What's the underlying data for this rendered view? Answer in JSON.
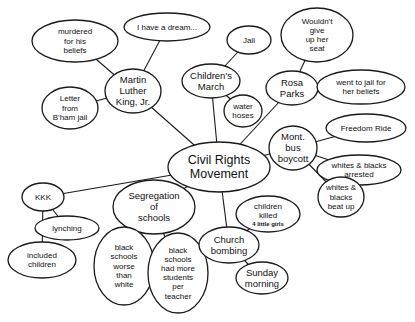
{
  "diagram": {
    "type": "concept-map",
    "central": {
      "id": "crm",
      "lines": [
        "Civil Rights",
        "Movement"
      ]
    },
    "nodes": [
      {
        "id": "crm",
        "lines": [
          "Civil Rights",
          "Movement"
        ],
        "cx": 219,
        "cy": 167,
        "rx": 51,
        "ry": 25,
        "size": "main"
      },
      {
        "id": "mlk",
        "lines": [
          "Martin",
          "Luther",
          "King, Jr."
        ],
        "cx": 133,
        "cy": 91,
        "rx": 28,
        "ry": 22,
        "size": "med"
      },
      {
        "id": "murdered",
        "lines": [
          "murdered",
          "for his",
          "beliefs"
        ],
        "cx": 75,
        "cy": 41,
        "rx": 43,
        "ry": 21,
        "size": "sm"
      },
      {
        "id": "dream",
        "lines": [
          "I have a dream..."
        ],
        "cx": 167,
        "cy": 27,
        "rx": 43,
        "ry": 14,
        "size": "sm"
      },
      {
        "id": "letter",
        "lines": [
          "Letter",
          "from",
          "B'ham jail"
        ],
        "cx": 70,
        "cy": 108,
        "rx": 28,
        "ry": 21,
        "size": "sm"
      },
      {
        "id": "jail",
        "lines": [
          "Jail"
        ],
        "cx": 249,
        "cy": 40,
        "rx": 22,
        "ry": 14,
        "size": "sm"
      },
      {
        "id": "childrens_march",
        "lines": [
          "Children's",
          "March"
        ],
        "cx": 211,
        "cy": 81,
        "rx": 29,
        "ry": 17,
        "size": "med"
      },
      {
        "id": "water_hoses",
        "lines": [
          "water",
          "hoses"
        ],
        "cx": 243,
        "cy": 111,
        "rx": 19,
        "ry": 16,
        "size": "sm"
      },
      {
        "id": "rosa_parks",
        "lines": [
          "Rosa",
          "Parks"
        ],
        "cx": 292,
        "cy": 88,
        "rx": 26,
        "ry": 17,
        "size": "med"
      },
      {
        "id": "seat",
        "lines": [
          "Wouldn't",
          "give",
          "up her",
          "seat"
        ],
        "cx": 317,
        "cy": 35,
        "rx": 36,
        "ry": 27,
        "size": "sm"
      },
      {
        "id": "rp_jail",
        "lines": [
          "went to jail for",
          "her beliefs"
        ],
        "cx": 361,
        "cy": 87,
        "rx": 44,
        "ry": 17,
        "size": "sm"
      },
      {
        "id": "boycott",
        "lines": [
          "Mont.",
          "bus",
          "boycott"
        ],
        "cx": 293,
        "cy": 148,
        "rx": 24,
        "ry": 22,
        "size": "med"
      },
      {
        "id": "freedom_ride",
        "lines": [
          "Freedom Ride"
        ],
        "cx": 366,
        "cy": 128,
        "rx": 40,
        "ry": 14,
        "size": "sm"
      },
      {
        "id": "arrested",
        "lines": [
          "whites & blacks",
          "arrested"
        ],
        "cx": 359,
        "cy": 170,
        "rx": 42,
        "ry": 15,
        "size": "sm"
      },
      {
        "id": "beat_up",
        "lines": [
          "whites &",
          "blacks",
          "beat up"
        ],
        "cx": 341,
        "cy": 197,
        "rx": 23,
        "ry": 20,
        "size": "sm"
      },
      {
        "id": "kkk",
        "lines": [
          "KKK"
        ],
        "cx": 43,
        "cy": 197,
        "rx": 21,
        "ry": 14,
        "size": "sm"
      },
      {
        "id": "lynching",
        "lines": [
          "lynching"
        ],
        "cx": 67,
        "cy": 228,
        "rx": 32,
        "ry": 12,
        "size": "sm"
      },
      {
        "id": "included_children",
        "lines": [
          "included",
          "children"
        ],
        "cx": 42,
        "cy": 260,
        "rx": 34,
        "ry": 18,
        "size": "sm"
      },
      {
        "id": "segregation",
        "lines": [
          "Segregation",
          "of",
          "schools"
        ],
        "cx": 154,
        "cy": 207,
        "rx": 41,
        "ry": 27,
        "size": "med"
      },
      {
        "id": "worse",
        "lines": [
          "black",
          "schools",
          "worse",
          "than",
          "white"
        ],
        "cx": 124,
        "cy": 266,
        "rx": 30,
        "ry": 39,
        "size": "sm"
      },
      {
        "id": "more_students",
        "lines": [
          "black",
          "schools",
          "had more",
          "students",
          "per",
          "teacher"
        ],
        "cx": 178,
        "cy": 273,
        "rx": 30,
        "ry": 40,
        "size": "sm"
      },
      {
        "id": "church",
        "lines": [
          "Church",
          "bombing"
        ],
        "cx": 229,
        "cy": 245,
        "rx": 30,
        "ry": 18,
        "size": "med"
      },
      {
        "id": "children_killed",
        "lines": [
          "children",
          "killed"
        ],
        "sublines": [
          "4 little girls"
        ],
        "cx": 268,
        "cy": 214,
        "rx": 32,
        "ry": 18,
        "size": "sm"
      },
      {
        "id": "sunday",
        "lines": [
          "Sunday",
          "morning"
        ],
        "cx": 262,
        "cy": 278,
        "rx": 26,
        "ry": 16,
        "size": "med"
      }
    ],
    "edges": [
      {
        "from": "crm",
        "to": "mlk",
        "x1": 177,
        "y1": 153,
        "x2": 157,
        "y2": 108
      },
      {
        "from": "crm",
        "to": "childrens_march",
        "x1": 211,
        "y1": 142,
        "x2": 211,
        "y2": 98
      },
      {
        "from": "crm",
        "to": "rosa_parks",
        "x1": 250,
        "y1": 147,
        "x2": 284,
        "y2": 104
      },
      {
        "from": "crm",
        "to": "boycott",
        "x1": 267,
        "y1": 160,
        "x2": 271,
        "y2": 157
      },
      {
        "from": "crm",
        "to": "kkk",
        "x1": 169,
        "y1": 162,
        "x2": 55,
        "y2": 186
      },
      {
        "from": "crm",
        "to": "segregation",
        "x1": 190,
        "y1": 188,
        "x2": 185,
        "y2": 190
      },
      {
        "from": "crm",
        "to": "church",
        "x1": 220,
        "y1": 192,
        "x2": 224,
        "y2": 227
      },
      {
        "from": "mlk",
        "to": "murdered",
        "x1": 117,
        "y1": 73,
        "x2": 106,
        "y2": 56
      },
      {
        "from": "mlk",
        "to": "dream",
        "x1": 136,
        "y1": 69,
        "x2": 145,
        "y2": 40
      },
      {
        "from": "mlk",
        "to": "letter",
        "x1": 106,
        "y1": 97,
        "x2": 97,
        "y2": 100
      },
      {
        "from": "childrens_march",
        "to": "jail",
        "x1": 222,
        "y1": 65,
        "x2": 236,
        "y2": 52
      },
      {
        "from": "childrens_march",
        "to": "water_hoses",
        "x1": 223,
        "y1": 97,
        "x2": 229,
        "y2": 100
      },
      {
        "from": "rosa_parks",
        "to": "seat",
        "x1": 298,
        "y1": 71,
        "x2": 303,
        "y2": 60
      },
      {
        "from": "rosa_parks",
        "to": "rp_jail",
        "x1": 318,
        "y1": 89,
        "x2": 317,
        "y2": 89
      },
      {
        "from": "boycott",
        "to": "freedom_ride",
        "x1": 315,
        "y1": 139,
        "x2": 330,
        "y2": 134
      },
      {
        "from": "boycott",
        "to": "arrested",
        "x1": 316,
        "y1": 156,
        "x2": 320,
        "y2": 162
      },
      {
        "from": "boycott",
        "to": "beat_up",
        "x1": 306,
        "y1": 167,
        "x2": 324,
        "y2": 184
      },
      {
        "from": "kkk",
        "to": "lynching",
        "x1": 50,
        "y1": 210,
        "x2": 55,
        "y2": 216
      },
      {
        "from": "kkk",
        "to": "included_children",
        "x1": 33,
        "y1": 209,
        "x2": 28,
        "y2": 244
      },
      {
        "from": "segregation",
        "to": "worse",
        "x1": 133,
        "y1": 230,
        "x2": 126,
        "y2": 228
      },
      {
        "from": "segregation",
        "to": "more_students",
        "x1": 160,
        "y1": 233,
        "x2": 166,
        "y2": 236
      },
      {
        "from": "church",
        "to": "children_killed",
        "x1": 242,
        "y1": 229,
        "x2": 246,
        "y2": 227
      },
      {
        "from": "church",
        "to": "sunday",
        "x1": 246,
        "y1": 260,
        "x2": 250,
        "y2": 264
      }
    ]
  }
}
